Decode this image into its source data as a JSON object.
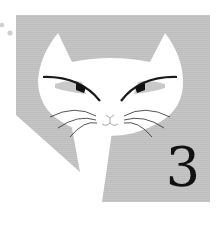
{
  "illustration": {
    "subject": "white cat face with whiskers on gray striped panel",
    "number_label": "3",
    "colors": {
      "panel": "#c4c4c4",
      "cat": "#ffffff",
      "lines": "#1a1a1a",
      "dots": "#c8c8c8"
    }
  }
}
